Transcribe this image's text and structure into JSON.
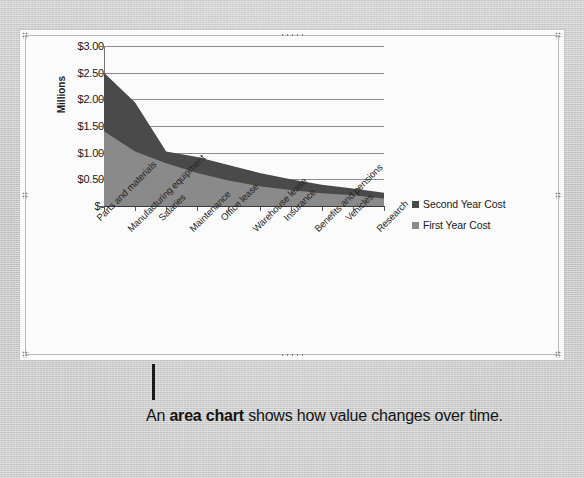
{
  "figure": {
    "caption_prefix": "An ",
    "caption_bold": "area chart",
    "caption_suffix": " shows how value changes over time."
  },
  "colors": {
    "series_first_year": "#8a8a8a",
    "series_second_year": "#4a4a4a",
    "gridline": "#8e8e8e",
    "axis": "#3a3a3a",
    "frame_border": "#b9b9b9",
    "page_background": "#cdcdcd",
    "frame_background": "#fbfbfb"
  },
  "chart_data": {
    "type": "area",
    "stacked": true,
    "title": "",
    "xlabel": "",
    "ylabel": "Millions",
    "ylim": [
      0,
      3.0
    ],
    "ytick_labels": [
      "$3.00",
      "$2.50",
      "$2.00",
      "$1.50",
      "$1.00",
      "$0.50",
      "$-"
    ],
    "ytick_values": [
      3.0,
      2.5,
      2.0,
      1.5,
      1.0,
      0.5,
      0.0
    ],
    "grid": true,
    "legend_position": "right",
    "categories": [
      "Parts and materials",
      "Manufacturing equipment",
      "Salaries",
      "Maintenance",
      "Office lease",
      "Warehouse lease",
      "Insurance",
      "Benefits and pensions",
      "Vehicles",
      "Research"
    ],
    "series": [
      {
        "name": "First Year Cost",
        "values": [
          1.4,
          1.02,
          0.8,
          0.62,
          0.48,
          0.37,
          0.3,
          0.24,
          0.2,
          0.14
        ]
      },
      {
        "name": "Second Year Cost",
        "values": [
          1.1,
          0.92,
          0.22,
          0.3,
          0.29,
          0.25,
          0.2,
          0.16,
          0.13,
          0.11
        ]
      }
    ],
    "totals": [
      2.5,
      1.94,
      1.02,
      0.92,
      0.77,
      0.62,
      0.5,
      0.4,
      0.33,
      0.25
    ]
  },
  "legend": {
    "entries": [
      {
        "label": "Second Year Cost",
        "color": "#4a4a4a"
      },
      {
        "label": "First Year Cost",
        "color": "#8a8a8a"
      }
    ]
  }
}
